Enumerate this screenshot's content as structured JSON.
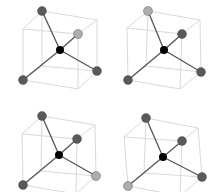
{
  "diagram": {
    "title": "",
    "colors": {
      "background": "#ffffff",
      "cube_edge": "#cfcfcf",
      "bond": "#555555",
      "center_atom": "#000000",
      "dark_atom": "#5a5a5a",
      "light_atom": "#adadad"
    },
    "panels": [
      {
        "id": "top-left",
        "offset": [
          0,
          0
        ],
        "center": [
          60,
          50
        ],
        "atoms": [
          {
            "pos": [
              42,
              11
            ],
            "shade": "dark"
          },
          {
            "pos": [
              78,
              34
            ],
            "shade": "light"
          },
          {
            "pos": [
              97,
              71
            ],
            "shade": "dark"
          },
          {
            "pos": [
              23,
              80
            ],
            "shade": "dark"
          }
        ]
      },
      {
        "id": "top-right",
        "offset": [
          0,
          0
        ],
        "center": [
          164,
          50
        ],
        "atoms": [
          {
            "pos": [
              148,
              11
            ],
            "shade": "light"
          },
          {
            "pos": [
              182,
              34
            ],
            "shade": "dark"
          },
          {
            "pos": [
              201,
              72
            ],
            "shade": "dark"
          },
          {
            "pos": [
              128,
              80
            ],
            "shade": "dark"
          }
        ]
      },
      {
        "id": "bottom-left",
        "offset": [
          0,
          0
        ],
        "center": [
          59,
          155
        ],
        "atoms": [
          {
            "pos": [
              42,
              116
            ],
            "shade": "dark"
          },
          {
            "pos": [
              77,
              139
            ],
            "shade": "dark"
          },
          {
            "pos": [
              96,
              176
            ],
            "shade": "light"
          },
          {
            "pos": [
              23,
              185
            ],
            "shade": "dark"
          }
        ]
      },
      {
        "id": "bottom-right",
        "offset": [
          0,
          0
        ],
        "center": [
          163,
          157
        ],
        "atoms": [
          {
            "pos": [
              146,
              118
            ],
            "shade": "dark"
          },
          {
            "pos": [
              182,
              141
            ],
            "shade": "dark"
          },
          {
            "pos": [
              202,
              177
            ],
            "shade": "dark"
          },
          {
            "pos": [
              128,
              186
            ],
            "shade": "light"
          }
        ]
      }
    ]
  }
}
